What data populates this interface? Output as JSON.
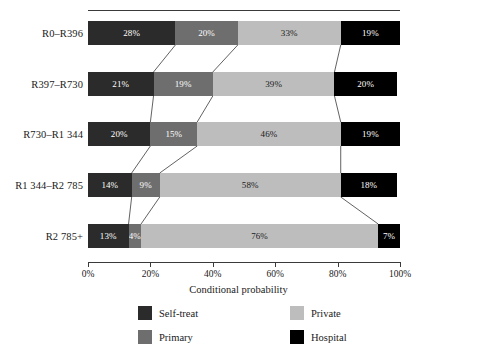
{
  "chart_data": {
    "type": "bar",
    "subtype": "stacked-horizontal-100-percent",
    "title": "",
    "xlabel": "Conditional probability",
    "ylabel": "",
    "xlim": [
      0,
      100
    ],
    "grid": false,
    "legend_position": "bottom",
    "categories": [
      "R0–R396",
      "R397–R730",
      "R730–R1 344",
      "R1 344–R2 785",
      "R2 785+"
    ],
    "series": [
      {
        "name": "Self-treat",
        "color": "#2b2b2b",
        "values": [
          28,
          21,
          20,
          14,
          13
        ]
      },
      {
        "name": "Primary",
        "color": "#6e6e6e",
        "values": [
          20,
          19,
          15,
          9,
          4
        ]
      },
      {
        "name": "Private",
        "color": "#bdbdbd",
        "values": [
          33,
          39,
          46,
          58,
          76
        ]
      },
      {
        "name": "Hospital",
        "color": "#000000",
        "values": [
          19,
          20,
          19,
          18,
          7
        ]
      }
    ],
    "data_labels": [
      [
        "28%",
        "20%",
        "33%",
        "19%"
      ],
      [
        "21%",
        "19%",
        "39%",
        "20%"
      ],
      [
        "20%",
        "15%",
        "46%",
        "19%"
      ],
      [
        "14%",
        "9%",
        "58%",
        "18%"
      ],
      [
        "13%",
        "4%",
        "76%",
        "7%"
      ]
    ],
    "xticks": [
      0,
      20,
      40,
      60,
      80,
      100
    ],
    "xtick_labels": [
      "0%",
      "20%",
      "40%",
      "60%",
      "80%",
      "100%"
    ],
    "connector_lines": true,
    "top_rule": true
  },
  "legend": {
    "items": [
      {
        "label": "Self-treat",
        "color": "#2b2b2b"
      },
      {
        "label": "Private",
        "color": "#bdbdbd"
      },
      {
        "label": "Primary",
        "color": "#6e6e6e"
      },
      {
        "label": "Hospital",
        "color": "#000000"
      }
    ]
  }
}
